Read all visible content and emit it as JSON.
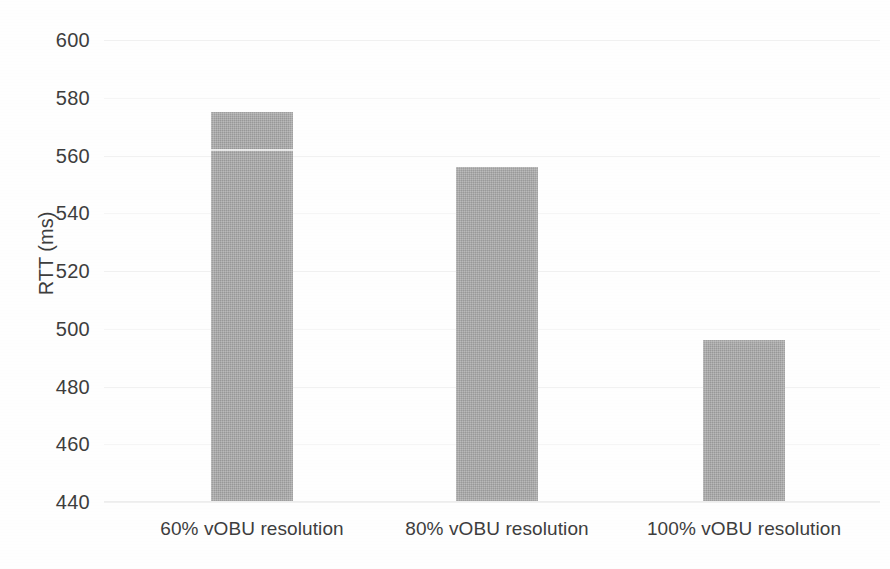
{
  "chart_data": {
    "type": "bar",
    "title": "",
    "subtitle": "",
    "xlabel": "",
    "ylabel": "RTT (ms)",
    "categories": [
      "60% vOBU resolution",
      "80% vOBU resolution",
      "100% vOBU resolution"
    ],
    "values": [
      575,
      556,
      496
    ],
    "ylim": [
      440,
      600
    ],
    "ytick_step": 20,
    "ytick_labels": [
      "600",
      "580",
      "560",
      "540",
      "520",
      "500",
      "480",
      "460",
      "440"
    ],
    "ytick_values": [
      600,
      580,
      560,
      540,
      520,
      500,
      480,
      460,
      440
    ],
    "grid": true,
    "grid_axis": "y",
    "legend": false,
    "legend_position": "none",
    "series": [
      {
        "name": "RTT",
        "values": [
          575,
          556,
          496
        ]
      }
    ],
    "colors": {
      "bar_fill": "#a8a8a8",
      "gridline": "#f1f1f1",
      "text": "#3d3d3d",
      "background": "#fefefe"
    }
  },
  "axes": {
    "y_title": "RTT (ms)",
    "y_ticks": [
      {
        "label": "600",
        "value": 600
      },
      {
        "label": "580",
        "value": 580
      },
      {
        "label": "560",
        "value": 560
      },
      {
        "label": "540",
        "value": 540
      },
      {
        "label": "520",
        "value": 520
      },
      {
        "label": "500",
        "value": 500
      },
      {
        "label": "480",
        "value": 480
      },
      {
        "label": "460",
        "value": 460
      },
      {
        "label": "440",
        "value": 440
      }
    ],
    "x_ticks": [
      {
        "label": "60% vOBU resolution"
      },
      {
        "label": "80% vOBU resolution"
      },
      {
        "label": "100% vOBU resolution"
      }
    ]
  },
  "bars": [
    {
      "label": "60% vOBU resolution",
      "value": 575
    },
    {
      "label": "80% vOBU resolution",
      "value": 556
    },
    {
      "label": "100% vOBU resolution",
      "value": 496
    }
  ]
}
